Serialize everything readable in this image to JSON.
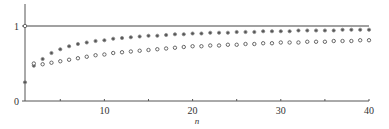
{
  "chart_data": {
    "type": "scatter",
    "title": "",
    "xlabel": "n",
    "ylabel": "",
    "xlim": [
      1,
      40
    ],
    "ylim": [
      0,
      1.05
    ],
    "grid": false,
    "legend": null,
    "x_ticks": [
      10,
      20,
      30,
      40
    ],
    "x_tick_labels": [
      "10",
      "20",
      "30",
      "40"
    ],
    "y_ticks": [
      0,
      1
    ],
    "y_tick_labels": [
      "0",
      "1"
    ],
    "reference_line": {
      "y": 1,
      "from_x": 1,
      "to_x": 40
    },
    "x": [
      1,
      2,
      3,
      4,
      5,
      6,
      7,
      8,
      9,
      10,
      11,
      12,
      13,
      14,
      15,
      16,
      17,
      18,
      19,
      20,
      21,
      22,
      23,
      24,
      25,
      26,
      27,
      28,
      29,
      30,
      31,
      32,
      33,
      34,
      35,
      36,
      37,
      38,
      39,
      40
    ],
    "series": [
      {
        "name": "filled-dot series (upper)",
        "marker": "dot",
        "values": [
          0.25,
          0.47,
          0.56,
          0.64,
          0.69,
          0.73,
          0.76,
          0.78,
          0.8,
          0.81,
          0.83,
          0.84,
          0.85,
          0.86,
          0.87,
          0.87,
          0.88,
          0.89,
          0.89,
          0.9,
          0.9,
          0.91,
          0.91,
          0.91,
          0.92,
          0.92,
          0.92,
          0.93,
          0.93,
          0.93,
          0.93,
          0.94,
          0.94,
          0.94,
          0.94,
          0.94,
          0.95,
          0.95,
          0.95,
          0.95
        ]
      },
      {
        "name": "open-circle series (lower)",
        "marker": "circle",
        "values": [
          1.0,
          0.5,
          0.49,
          0.51,
          0.53,
          0.55,
          0.57,
          0.59,
          0.61,
          0.62,
          0.64,
          0.65,
          0.66,
          0.67,
          0.68,
          0.69,
          0.7,
          0.71,
          0.72,
          0.73,
          0.73,
          0.74,
          0.74,
          0.75,
          0.75,
          0.76,
          0.76,
          0.77,
          0.77,
          0.78,
          0.78,
          0.78,
          0.79,
          0.79,
          0.79,
          0.8,
          0.8,
          0.8,
          0.81,
          0.81
        ]
      }
    ]
  }
}
